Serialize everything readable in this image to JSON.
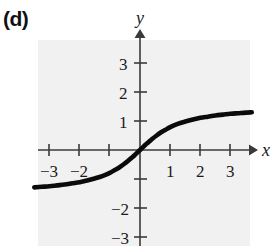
{
  "figure": {
    "part_label": "(d)",
    "background_color": "#ffffff",
    "panel_color": "#f1f1f1",
    "curve_color": "#0b0b0b",
    "axis_color": "#3a3a3a"
  },
  "chart_data": {
    "type": "line",
    "title": "",
    "subtitle": "",
    "xlabel": "x",
    "ylabel": "y",
    "xlim": [
      -3.5,
      3.7
    ],
    "ylim": [
      -3.6,
      3.5
    ],
    "grid": false,
    "legend": null,
    "x_ticks": [
      -3,
      -2,
      -1,
      1,
      2,
      3
    ],
    "x_tick_labels": [
      "-3",
      "-2",
      "",
      "1",
      "2",
      "3"
    ],
    "y_ticks": [
      -3,
      -2,
      -1,
      1,
      2,
      3
    ],
    "y_tick_labels": [
      "-3",
      "-2",
      "",
      "1",
      "2",
      "3"
    ],
    "annotations": [],
    "series": [
      {
        "name": "curve",
        "description": "monotonic increasing odd function through origin with horizontal asymptotes near y = +1.3 and y = -1.3",
        "x": [
          -3.5,
          -3.25,
          -3.0,
          -2.75,
          -2.5,
          -2.25,
          -2.0,
          -1.75,
          -1.5,
          -1.25,
          -1.0,
          -0.85,
          -0.7,
          -0.55,
          -0.4,
          -0.28,
          -0.18,
          -0.1,
          -0.05,
          0.0,
          0.05,
          0.1,
          0.18,
          0.28,
          0.4,
          0.55,
          0.7,
          0.85,
          1.0,
          1.25,
          1.5,
          1.75,
          2.0,
          2.25,
          2.5,
          2.75,
          3.0,
          3.25,
          3.5,
          3.7
        ],
        "y": [
          -1.29,
          -1.27,
          -1.25,
          -1.22,
          -1.19,
          -1.15,
          -1.11,
          -1.05,
          -0.98,
          -0.9,
          -0.79,
          -0.7,
          -0.61,
          -0.5,
          -0.38,
          -0.27,
          -0.18,
          -0.1,
          -0.05,
          0.0,
          0.05,
          0.1,
          0.18,
          0.27,
          0.38,
          0.5,
          0.61,
          0.7,
          0.79,
          0.9,
          0.98,
          1.05,
          1.11,
          1.15,
          1.19,
          1.22,
          1.25,
          1.27,
          1.29,
          1.3
        ]
      }
    ]
  },
  "labels": {
    "x_axis_name": "x",
    "y_axis_name": "y",
    "x_neg3": "−3",
    "x_neg2": "−2",
    "x_pos1": "1",
    "x_pos2": "2",
    "x_pos3": "3",
    "y_pos1": "1",
    "y_pos2": "2",
    "y_pos3": "3",
    "y_neg2": "−2",
    "y_neg3": "−3"
  }
}
